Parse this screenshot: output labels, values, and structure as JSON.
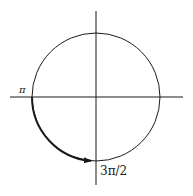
{
  "diagram": {
    "type": "unit-circle",
    "labels": {
      "left": "π",
      "bottom": "3π/2"
    },
    "arc": {
      "from": "π",
      "to": "3π/2",
      "direction": "counterclockwise",
      "arrow": true
    },
    "colors": {
      "stroke": "#1a1a1a",
      "background": "#ffffff"
    }
  }
}
